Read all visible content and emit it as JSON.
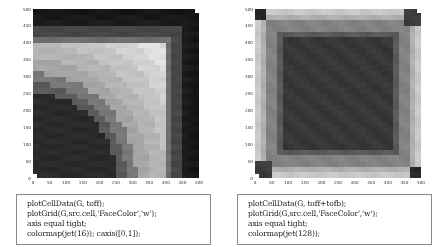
{
  "figures": [
    {
      "id": "left",
      "axis": {
        "x_ticks": [
          "0",
          "50",
          "100",
          "150",
          "200",
          "250",
          "300",
          "350",
          "400",
          "450",
          "500"
        ],
        "y_ticks": [
          "0",
          "50",
          "100",
          "150",
          "200",
          "250",
          "300",
          "350",
          "400",
          "450",
          "500"
        ],
        "xlim": [
          0,
          500
        ],
        "ylim": [
          0,
          500
        ]
      },
      "plot": {
        "type": "heatmap",
        "colormap": "jet(16)",
        "caxis": [
          0,
          1
        ],
        "description": "Time-of-flight from source at lower-left corner, quarter-circle bands in 16 discrete levels",
        "grid_cells": 30,
        "source_marker": "bottom-left",
        "sink_marker": "top-right"
      },
      "code": [
        "plotCellData(G, toff);",
        "plotGrid(G,src.cell,'FaceColor','w');",
        "axis equal tight;",
        "colormap(jet(16)); caxis([0,1]);"
      ]
    },
    {
      "id": "right",
      "axis": {
        "x_ticks": [
          "0",
          "50",
          "100",
          "150",
          "200",
          "250",
          "300",
          "350",
          "400",
          "450",
          "500"
        ],
        "y_ticks": [
          "0",
          "50",
          "100",
          "150",
          "200",
          "250",
          "300",
          "350",
          "400",
          "450",
          "500"
        ],
        "xlim": [
          0,
          500
        ],
        "ylim": [
          0,
          500
        ]
      },
      "plot": {
        "type": "heatmap",
        "colormap": "jet(128)",
        "description": "Total travel time toff+tofb, low in center region, high along stagnant edges",
        "grid_cells": 30,
        "source_marker": "bottom-left",
        "sink_marker": "top-right"
      },
      "code": [
        "plotCellData(G, toff+tofb);",
        "plotGrid(G,src.cell,'FaceColor','w');",
        "axis equal tight;",
        "colormap(jet(128));"
      ]
    }
  ],
  "chart_data": [
    {
      "type": "heatmap",
      "title": "",
      "xlabel": "",
      "ylabel": "",
      "x_ticks": [
        0,
        50,
        100,
        150,
        200,
        250,
        300,
        350,
        400,
        450,
        500
      ],
      "y_ticks": [
        0,
        50,
        100,
        150,
        200,
        250,
        300,
        350,
        400,
        450,
        500
      ],
      "xlim": [
        0,
        500
      ],
      "ylim": [
        0,
        500
      ],
      "colormap": "jet(16)",
      "caxis": [
        0,
        1
      ],
      "grid": false
    },
    {
      "type": "heatmap",
      "title": "",
      "xlabel": "",
      "ylabel": "",
      "x_ticks": [
        0,
        50,
        100,
        150,
        200,
        250,
        300,
        350,
        400,
        450,
        500
      ],
      "y_ticks": [
        0,
        50,
        100,
        150,
        200,
        250,
        300,
        350,
        400,
        450,
        500
      ],
      "xlim": [
        0,
        500
      ],
      "ylim": [
        0,
        500
      ],
      "colormap": "jet(128)",
      "grid": false
    }
  ]
}
